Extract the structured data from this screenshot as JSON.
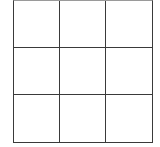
{
  "grid": {
    "rows": 3,
    "columns": 3,
    "line_color": "#3a3a3a",
    "background": "#ffffff",
    "cells": [
      [
        "",
        "",
        ""
      ],
      [
        "",
        "",
        ""
      ],
      [
        "",
        "",
        ""
      ]
    ]
  }
}
